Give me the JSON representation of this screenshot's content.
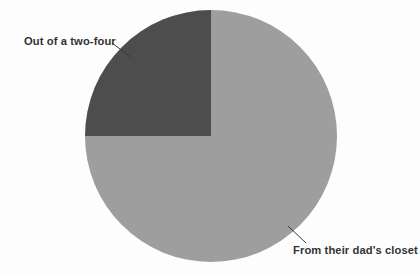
{
  "chart_data": {
    "type": "pie",
    "title": "",
    "subtitle": "",
    "xlabel": "",
    "ylabel": "",
    "legend_position": "none",
    "grid": false,
    "labels_position": "outside-with-leader-lines",
    "total": 100,
    "units": "percent",
    "categories": [
      "Out of a two-four",
      "From their dad's closet"
    ],
    "values": [
      25,
      75
    ],
    "slices": [
      {
        "label": "Out of a two-four",
        "value": 25,
        "percent": 25,
        "color": "#4d4d4d",
        "start_angle_deg": 270,
        "end_angle_deg": 360,
        "quadrant": "upper-left"
      },
      {
        "label": "From their dad's closet",
        "value": 75,
        "percent": 75,
        "color": "#9e9e9e",
        "start_angle_deg": 0,
        "end_angle_deg": 270,
        "quadrant": "upper-right-lower-right-lower-left"
      }
    ],
    "annotations": [
      {
        "text": "Out of a two-four",
        "target_slice": "Out of a two-four",
        "leader_line": true
      },
      {
        "text": "From their dad's closet",
        "target_slice": "From their dad's closet",
        "leader_line": true
      }
    ]
  },
  "geometry": {
    "center_x": 211,
    "center_y": 136,
    "radius": 126
  },
  "colors": {
    "background": "#fdfdfd",
    "slice_dark": "#4d4d4d",
    "slice_light": "#9e9e9e",
    "text": "#333333",
    "leader_line": "#3a3a3a"
  },
  "labels": {
    "dark_slice": "Out of a two-four",
    "light_slice": "From their dad's closet"
  }
}
